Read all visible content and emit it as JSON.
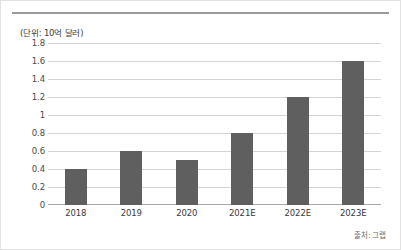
{
  "unit_label": "(단위: 10억 달러)",
  "source_label": "출처: 그랩",
  "colors": {
    "bar": "#5f5f5f",
    "grid": "#d4d4d4",
    "axis": "#a8a8a8",
    "text": "#3a3a3a",
    "rule": "#9a9a9a"
  },
  "chart_data": {
    "type": "bar",
    "title": "",
    "subtitle": "",
    "xlabel": "",
    "ylabel": "(단위: 10억 달러)",
    "categories": [
      "2018",
      "2019",
      "2020",
      "2021E",
      "2022E",
      "2023E"
    ],
    "values": [
      0.4,
      0.6,
      0.5,
      0.8,
      1.2,
      1.6
    ],
    "series": [
      {
        "name": "",
        "values": [
          0.4,
          0.6,
          0.5,
          0.8,
          1.2,
          1.6
        ]
      }
    ],
    "ylim": [
      0,
      1.8
    ],
    "yticks": [
      0,
      0.2,
      0.4,
      0.6,
      0.8,
      1,
      1.2,
      1.4,
      1.6,
      1.8
    ],
    "ytick_labels": [
      "0",
      "0.2",
      "0.4",
      "0.6",
      "0.8",
      "1",
      "1.2",
      "1.4",
      "1.6",
      "1.8"
    ],
    "grid": true,
    "legend": false,
    "legend_position": "none",
    "annotations": [
      "(단위: 10억 달러)",
      "출처: 그랩"
    ]
  }
}
